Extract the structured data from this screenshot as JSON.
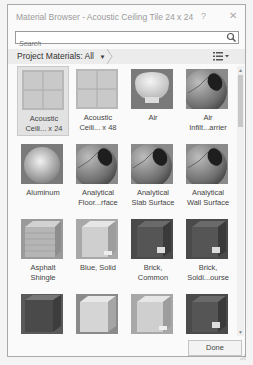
{
  "window": {
    "title": "Material Browser - Acoustic Ceiling Tile 24 x 24",
    "help_label": "?",
    "close_label": "✕"
  },
  "search": {
    "placeholder": "Search",
    "value": "",
    "icon": "search-icon"
  },
  "breadcrumb": {
    "label": "Project Materials: All",
    "dropdown_icon": "▼",
    "view_icon": "list-view-icon"
  },
  "materials": [
    {
      "label": "Acoustic\nCeili... x 24",
      "thumb": "ceiling-tile",
      "selected": true
    },
    {
      "label": "Acoustic\nCeili... x 48",
      "thumb": "ceiling-tile",
      "selected": false
    },
    {
      "label": "Air",
      "thumb": "dome",
      "selected": false
    },
    {
      "label": "Air\nInfilt...arrier",
      "thumb": "analytical-sphere",
      "selected": false
    },
    {
      "label": "Aluminum",
      "thumb": "metal-sphere",
      "selected": false
    },
    {
      "label": "Analytical\nFloor...rface",
      "thumb": "analytical-sphere",
      "selected": false
    },
    {
      "label": "Analytical\nSlab Surface",
      "thumb": "analytical-sphere",
      "selected": false
    },
    {
      "label": "Analytical\nWall Surface",
      "thumb": "analytical-sphere",
      "selected": false
    },
    {
      "label": "Asphalt\nShingle",
      "thumb": "brick-cube-light",
      "selected": false
    },
    {
      "label": "Blue, Solid",
      "thumb": "cube-light",
      "selected": false
    },
    {
      "label": "Brick,\nCommon",
      "thumb": "cube-dark",
      "selected": false
    },
    {
      "label": "Brick,\nSoldi...ourse",
      "thumb": "cube-dark",
      "selected": false
    },
    {
      "label": "",
      "thumb": "cube-darkgray",
      "selected": false
    },
    {
      "label": "",
      "thumb": "cube-pale",
      "selected": false
    },
    {
      "label": "",
      "thumb": "cube-light",
      "selected": false
    },
    {
      "label": "",
      "thumb": "cube-dark",
      "selected": false
    }
  ],
  "footer": {
    "done_label": "Done"
  }
}
